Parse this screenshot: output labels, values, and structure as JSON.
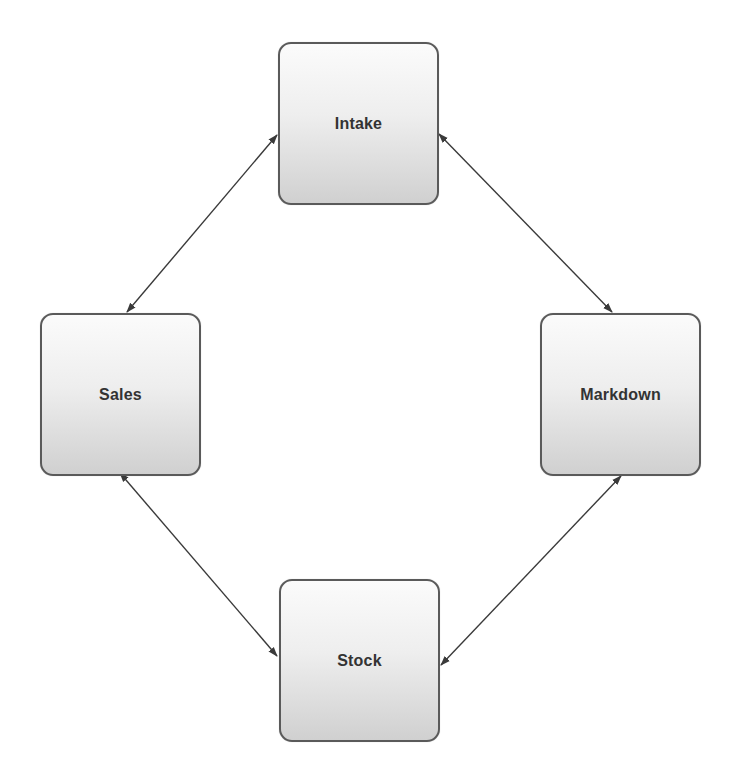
{
  "diagram": {
    "type": "cycle",
    "nodes": [
      {
        "id": "intake",
        "label": "Intake"
      },
      {
        "id": "markdown",
        "label": "Markdown"
      },
      {
        "id": "stock",
        "label": "Stock"
      },
      {
        "id": "sales",
        "label": "Sales"
      }
    ],
    "edges": [
      {
        "from": "intake",
        "to": "markdown",
        "direction": "bidirectional"
      },
      {
        "from": "markdown",
        "to": "stock",
        "direction": "bidirectional"
      },
      {
        "from": "stock",
        "to": "sales",
        "direction": "bidirectional"
      },
      {
        "from": "sales",
        "to": "intake",
        "direction": "bidirectional"
      }
    ],
    "colors": {
      "node_border": "#5a5a5a",
      "node_fill_top": "#fbfbfb",
      "node_fill_bottom": "#d0d0d0",
      "label": "#333333",
      "arrow": "#3a3a3a"
    }
  }
}
